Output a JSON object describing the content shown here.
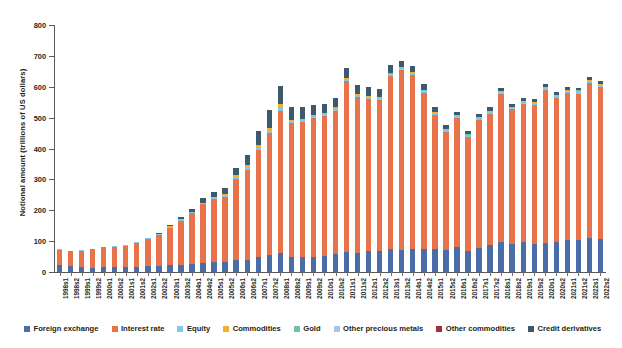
{
  "chart_data": {
    "type": "bar",
    "stacked": true,
    "title": "",
    "xlabel": "",
    "ylabel": "Notional amount (trillions of US dollars)",
    "ylim": [
      0,
      800
    ],
    "yticks": [
      0,
      100,
      200,
      300,
      400,
      500,
      600,
      700,
      800
    ],
    "grid": false,
    "legend_position": "bottom",
    "categories": [
      "1998s1",
      "1998s2",
      "1999s1",
      "1999s2",
      "2000s1",
      "2000s2",
      "2001s1",
      "2001s2",
      "2002s1",
      "2002s2",
      "2003s1",
      "2003s2",
      "2004s1",
      "2004s2",
      "2005s1",
      "2005s2",
      "2006s1",
      "2006s2",
      "2007s1",
      "2007s2",
      "2008s1",
      "2008s2",
      "2009s1",
      "2009s2",
      "2010s1",
      "2010s2",
      "2011s1",
      "2011s2",
      "2012s1",
      "2012s2",
      "2013s1",
      "2013s2",
      "2014s1",
      "2014s2",
      "2015s1",
      "2015s2",
      "2016s1",
      "2016s2",
      "2017s1",
      "2017s2",
      "2018s1",
      "2018s2",
      "2019s1",
      "2019s2",
      "2020s1",
      "2020s2",
      "2021s1",
      "2021s2",
      "2022s1",
      "2022s2"
    ],
    "series": [
      {
        "name": "Foreign exchange",
        "color": "#4a6da7",
        "values": [
          22,
          18,
          15,
          14,
          16,
          16,
          17,
          17,
          18,
          18,
          22,
          24,
          26,
          29,
          31,
          31,
          38,
          40,
          49,
          56,
          63,
          50,
          49,
          49,
          53,
          58,
          65,
          63,
          67,
          67,
          73,
          70,
          75,
          76,
          74,
          70,
          82,
          69,
          77,
          87,
          96,
          90,
          96,
          92,
          94,
          98,
          105,
          104,
          109,
          108
        ]
      },
      {
        "name": "Interest rate",
        "color": "#e8734a",
        "values": [
          50,
          50,
          54,
          60,
          64,
          65,
          67,
          77,
          90,
          102,
          122,
          142,
          164,
          191,
          205,
          212,
          262,
          292,
          347,
          393,
          458,
          433,
          437,
          450,
          452,
          465,
          554,
          504,
          494,
          490,
          561,
          584,
          563,
          505,
          435,
          384,
          418,
          368,
          416,
          426,
          481,
          437,
          449,
          449,
          495,
          466,
          475,
          474,
          503,
          490
        ]
      },
      {
        "name": "Equity",
        "color": "#7ecbe8",
        "values": [
          1,
          1,
          2,
          2,
          2,
          2,
          2,
          2,
          2,
          2,
          3,
          4,
          4,
          4,
          5,
          6,
          7,
          8,
          9,
          9,
          10,
          6,
          6,
          6,
          6,
          6,
          6,
          6,
          6,
          6,
          7,
          7,
          7,
          7,
          7,
          7,
          7,
          7,
          7,
          7,
          7,
          6,
          7,
          7,
          7,
          7,
          7,
          7,
          7,
          7
        ]
      },
      {
        "name": "Commodities",
        "color": "#f2b134",
        "values": [
          0,
          0,
          0,
          0,
          0,
          0,
          0,
          0,
          1,
          1,
          1,
          1,
          1,
          1,
          3,
          5,
          6,
          7,
          8,
          9,
          13,
          4,
          4,
          3,
          3,
          3,
          3,
          3,
          3,
          3,
          2,
          2,
          2,
          2,
          2,
          1,
          1,
          1,
          2,
          2,
          2,
          2,
          2,
          2,
          2,
          2,
          2,
          2,
          3,
          3
        ]
      },
      {
        "name": "Gold",
        "color": "#6ec3a0",
        "values": [
          0,
          0,
          0,
          0,
          0,
          0,
          0,
          0,
          0,
          0,
          0,
          0,
          0,
          0,
          0,
          0,
          0,
          0,
          0,
          0,
          1,
          1,
          1,
          1,
          1,
          1,
          1,
          1,
          1,
          1,
          1,
          1,
          1,
          1,
          1,
          1,
          1,
          1,
          1,
          1,
          1,
          1,
          1,
          1,
          1,
          1,
          1,
          1,
          1,
          1
        ]
      },
      {
        "name": "Other precious metals",
        "color": "#a9c7e8",
        "values": [
          0,
          0,
          0,
          0,
          0,
          0,
          0,
          0,
          0,
          0,
          0,
          0,
          0,
          0,
          0,
          0,
          0,
          0,
          0,
          0,
          0,
          0,
          0,
          0,
          0,
          0,
          0,
          0,
          0,
          0,
          0,
          0,
          0,
          0,
          0,
          0,
          0,
          0,
          0,
          0,
          0,
          0,
          0,
          0,
          0,
          0,
          0,
          0,
          0,
          0
        ]
      },
      {
        "name": "Other commodities",
        "color": "#9e3039",
        "values": [
          0,
          0,
          0,
          0,
          0,
          0,
          0,
          0,
          0,
          0,
          0,
          0,
          0,
          0,
          0,
          0,
          0,
          0,
          0,
          0,
          0,
          0,
          0,
          0,
          0,
          0,
          0,
          0,
          0,
          0,
          0,
          0,
          0,
          0,
          0,
          0,
          0,
          0,
          0,
          0,
          0,
          0,
          0,
          0,
          0,
          0,
          0,
          0,
          0,
          0
        ]
      },
      {
        "name": "Credit derivatives",
        "color": "#3c5a6e",
        "values": [
          0,
          0,
          0,
          0,
          0,
          0,
          0,
          0,
          0,
          2,
          4,
          6,
          9,
          14,
          16,
          19,
          25,
          31,
          43,
          58,
          57,
          42,
          36,
          33,
          30,
          30,
          32,
          29,
          27,
          25,
          25,
          21,
          20,
          17,
          15,
          12,
          11,
          10,
          10,
          10,
          9,
          8,
          8,
          8,
          9,
          9,
          9,
          9,
          10,
          10
        ]
      }
    ]
  },
  "legend": {
    "items": [
      {
        "label": "Foreign exchange",
        "color": "#4a6da7"
      },
      {
        "label": "Interest rate",
        "color": "#e8734a"
      },
      {
        "label": "Equity",
        "color": "#7ecbe8"
      },
      {
        "label": "Commodities",
        "color": "#f2b134"
      },
      {
        "label": "Gold",
        "color": "#6ec3a0"
      },
      {
        "label": "Other precious metals",
        "color": "#a9c7e8"
      },
      {
        "label": "Other commodities",
        "color": "#9e3039"
      },
      {
        "label": "Credit derivatives",
        "color": "#3c5a6e"
      }
    ]
  }
}
